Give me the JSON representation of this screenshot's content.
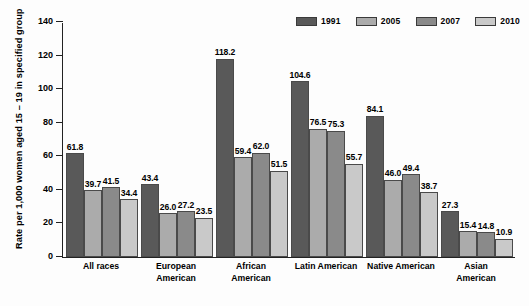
{
  "chart_data": {
    "type": "bar",
    "title": "",
    "xlabel": "",
    "ylabel": "Rate per 1,000 women aged 15 – 19 in specified group",
    "ylim": [
      0,
      140
    ],
    "yticks": [
      0,
      20,
      40,
      60,
      80,
      100,
      120,
      140
    ],
    "ytick_labels": [
      "0",
      "20",
      "40",
      "60",
      "80",
      "100",
      "120",
      "140"
    ],
    "grid": false,
    "legend_position": "top-right",
    "categories": [
      "All races",
      "European American",
      "African American",
      "Latin American",
      "Native American",
      "Asian American"
    ],
    "category_lines": [
      [
        "All races"
      ],
      [
        "European",
        "American"
      ],
      [
        "African",
        "American"
      ],
      [
        "Latin American"
      ],
      [
        "Native American"
      ],
      [
        "Asian",
        "American"
      ]
    ],
    "series": [
      {
        "name": "1991",
        "color": "#595959",
        "values": [
          61.8,
          43.4,
          118.2,
          104.6,
          84.1,
          27.3
        ],
        "labels": [
          "61.8",
          "43.4",
          "118.2",
          "104.6",
          "84.1",
          "27.3"
        ]
      },
      {
        "name": "2005",
        "color": "#ababab",
        "values": [
          39.7,
          26.0,
          59.4,
          76.5,
          46.0,
          15.4
        ],
        "labels": [
          "39.7",
          "26.0",
          "59.4",
          "76.5",
          "46.0",
          "15.4"
        ]
      },
      {
        "name": "2007",
        "color": "#8a8a8a",
        "values": [
          41.5,
          27.2,
          62.0,
          75.3,
          49.4,
          14.8
        ],
        "labels": [
          "41.5",
          "27.2",
          "62.0",
          "75.3",
          "49.4",
          "14.8"
        ]
      },
      {
        "name": "2010",
        "color": "#c9c9c9",
        "values": [
          34.4,
          23.5,
          51.5,
          55.7,
          38.7,
          10.9
        ],
        "labels": [
          "34.4",
          "23.5",
          "51.5",
          "55.7",
          "38.7",
          "10.9"
        ]
      }
    ]
  },
  "legend": {
    "entries": [
      {
        "label": "1991",
        "color": "#595959"
      },
      {
        "label": "2005",
        "color": "#ababab"
      },
      {
        "label": "2007",
        "color": "#8a8a8a"
      },
      {
        "label": "2010",
        "color": "#c9c9c9"
      }
    ]
  },
  "colors": {
    "axis": "#222222",
    "bar_outline": "#4a4a4a",
    "background": "#fdfdfd",
    "text": "#000000"
  }
}
